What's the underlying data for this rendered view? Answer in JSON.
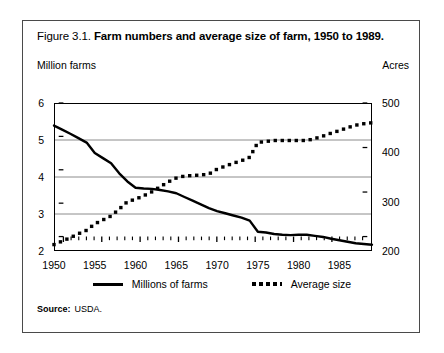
{
  "figure": {
    "number": "Figure 3.1.",
    "title": "Farm numbers and average size of farm, 1950 to 1989."
  },
  "source": {
    "label": "Source:",
    "value": "USDA."
  },
  "legend": {
    "position": "bottom-center",
    "entries": [
      {
        "label": "Millions of farms",
        "style": "solid",
        "color": "#000000"
      },
      {
        "label": "Average size",
        "style": "dotted",
        "color": "#000000"
      }
    ]
  },
  "chart_data": {
    "type": "line",
    "title": "Farm numbers and average size of farm, 1950 to 1989",
    "xlabel": "",
    "ylabel": "Million farms",
    "y2label": "Acres",
    "xlim": [
      1950,
      1989
    ],
    "ylim": [
      2,
      6
    ],
    "y2lim": [
      200,
      500
    ],
    "grid": true,
    "y_ticks": [
      2,
      3,
      4,
      5,
      6
    ],
    "y_tick_labels": [
      "2",
      "3",
      "4",
      "5",
      "6"
    ],
    "y2_ticks": [
      200,
      300,
      400,
      500
    ],
    "y2_tick_labels": [
      "200",
      "300",
      "400",
      "500"
    ],
    "x_ticks": [
      1950,
      1955,
      1960,
      1965,
      1970,
      1975,
      1980,
      1985
    ],
    "x_tick_labels": [
      "1950",
      "1955",
      "1960",
      "1965",
      "1970",
      "1975",
      "1980",
      "1985"
    ],
    "x_minor_tick_interval": 1,
    "x": [
      1950,
      1951,
      1952,
      1953,
      1954,
      1955,
      1956,
      1957,
      1958,
      1959,
      1960,
      1961,
      1962,
      1963,
      1964,
      1965,
      1966,
      1967,
      1968,
      1969,
      1970,
      1971,
      1972,
      1973,
      1974,
      1975,
      1976,
      1977,
      1978,
      1979,
      1980,
      1981,
      1982,
      1983,
      1984,
      1985,
      1986,
      1987,
      1988,
      1989
    ],
    "series": [
      {
        "name": "Millions of farms",
        "axis": "left",
        "unit": "million farms",
        "style": "solid",
        "color": "#000000",
        "values": [
          5.39,
          5.28,
          5.17,
          5.05,
          4.93,
          4.65,
          4.51,
          4.37,
          4.1,
          3.88,
          3.71,
          3.69,
          3.68,
          3.65,
          3.61,
          3.56,
          3.46,
          3.36,
          3.26,
          3.16,
          3.08,
          3.02,
          2.96,
          2.9,
          2.82,
          2.52,
          2.5,
          2.46,
          2.44,
          2.43,
          2.44,
          2.44,
          2.41,
          2.38,
          2.33,
          2.29,
          2.25,
          2.21,
          2.19,
          2.17
        ]
      },
      {
        "name": "Average size",
        "axis": "right",
        "unit": "acres",
        "style": "dotted",
        "color": "#000000",
        "values": [
          213,
          220,
          227,
          235,
          242,
          255,
          263,
          271,
          285,
          300,
          305,
          312,
          320,
          330,
          340,
          348,
          352,
          353,
          354,
          356,
          366,
          372,
          378,
          383,
          390,
          420,
          422,
          424,
          424,
          424,
          424,
          424,
          428,
          433,
          439,
          444,
          450,
          455,
          458,
          460
        ]
      }
    ],
    "annotations": [
      {
        "text": "series discontinuity between 1974 and 1975 (farm definition change)",
        "x": 1975
      }
    ]
  }
}
